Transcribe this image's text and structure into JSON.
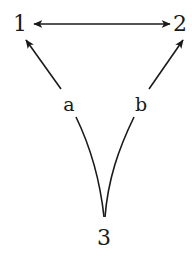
{
  "diagram": {
    "type": "directed-graph",
    "nodes": [
      {
        "id": "1",
        "label": "1"
      },
      {
        "id": "2",
        "label": "2"
      },
      {
        "id": "3",
        "label": "3"
      }
    ],
    "edge_labels": {
      "a": "a",
      "b": "b"
    },
    "edges": [
      {
        "from": "1",
        "to": "2",
        "bidirectional": true,
        "label": ""
      },
      {
        "from": "3",
        "to": "1",
        "label": "a",
        "style": "curved"
      },
      {
        "from": "3",
        "to": "2",
        "label": "b",
        "style": "curved"
      }
    ],
    "colors": {
      "ink": "#1a1a1a",
      "background": "#ffffff"
    }
  }
}
